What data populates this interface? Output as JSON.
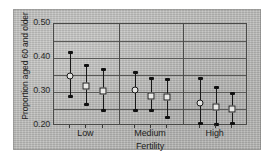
{
  "figure": {
    "background_color": "#b9b9b7",
    "plot_border_color": "#4a4a48"
  },
  "chart_data": {
    "type": "scatter",
    "title": "",
    "subtitle": "",
    "xlabel": "Fertility",
    "ylabel": "Proportion aged 60 and older",
    "ylim": [
      0.2,
      0.5
    ],
    "yticks": [
      "0.20",
      "0.30",
      "0.40",
      "0.50"
    ],
    "ytick_values": [
      0.2,
      0.3,
      0.4,
      0.5
    ],
    "categories": [
      "Low",
      "Medium",
      "High"
    ],
    "grid": true,
    "gridlines_y": [
      0.25,
      0.3,
      0.35,
      0.4,
      0.45
    ],
    "legend": "none",
    "marker_styles": [
      "open-circle",
      "open-square",
      "open-square"
    ],
    "annotations": [],
    "groups": [
      {
        "category": "Low",
        "points": [
          {
            "marker": "open-circle",
            "estimate": 0.348,
            "low": 0.288,
            "high": 0.417
          },
          {
            "marker": "open-square",
            "estimate": 0.317,
            "low": 0.266,
            "high": 0.379
          },
          {
            "marker": "open-square",
            "estimate": 0.303,
            "low": 0.248,
            "high": 0.367
          }
        ]
      },
      {
        "category": "Medium",
        "points": [
          {
            "marker": "open-circle",
            "estimate": 0.305,
            "low": 0.247,
            "high": 0.358
          },
          {
            "marker": "open-square",
            "estimate": 0.288,
            "low": 0.246,
            "high": 0.342
          },
          {
            "marker": "open-square",
            "estimate": 0.284,
            "low": 0.228,
            "high": 0.339
          }
        ]
      },
      {
        "category": "High",
        "points": [
          {
            "marker": "open-circle",
            "estimate": 0.268,
            "low": 0.208,
            "high": 0.34
          },
          {
            "marker": "open-square",
            "estimate": 0.256,
            "low": 0.207,
            "high": 0.316
          },
          {
            "marker": "open-square",
            "estimate": 0.25,
            "low": 0.208,
            "high": 0.297
          }
        ]
      }
    ]
  }
}
